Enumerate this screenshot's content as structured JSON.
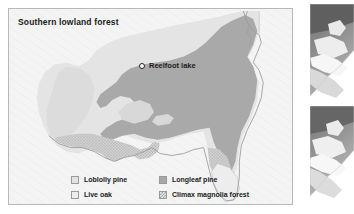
{
  "figure": {
    "title": "Southern lowland forest",
    "annotation": {
      "marker_icon": "circle-marker-icon",
      "label": "Reelfoot lake"
    }
  },
  "legend": {
    "items": [
      {
        "label": "Loblolly pine",
        "swatch": "solid-light-gray",
        "color": "#e2e2e2"
      },
      {
        "label": "Longleaf pine",
        "swatch": "solid-medium-gray",
        "color": "#a8a8a8"
      },
      {
        "label": "Live oak",
        "swatch": "solid-pale-gray",
        "color": "#ededed"
      },
      {
        "label": "Climax magnolia forest",
        "swatch": "hatched-gray",
        "color": "#c3c3c3"
      }
    ]
  },
  "map": {
    "background_color": "#f2f2f2",
    "land_outline_color": "#9b9b9b",
    "regions": [
      {
        "name": "loblolly-pine-region",
        "legend_key": "Loblolly pine"
      },
      {
        "name": "longleaf-pine-region",
        "legend_key": "Longleaf pine"
      },
      {
        "name": "live-oak-region",
        "legend_key": "Live oak"
      },
      {
        "name": "climax-magnolia-region",
        "legend_key": "Climax magnolia forest"
      }
    ]
  },
  "side_photos": [
    {
      "name": "photo-fragment-top",
      "caption": ""
    },
    {
      "name": "photo-fragment-bottom",
      "caption": ""
    }
  ]
}
